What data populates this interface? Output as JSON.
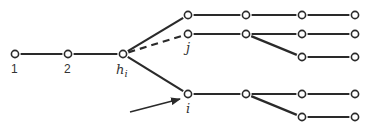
{
  "diagram": {
    "colors": {
      "stroke": "#2a2a2a",
      "node_fill": "#ffffff",
      "text": "#333333"
    },
    "nodes": [
      {
        "id": "n1",
        "x": 15,
        "y": 54,
        "label": "1"
      },
      {
        "id": "n2",
        "x": 68,
        "y": 54,
        "label": "2"
      },
      {
        "id": "hi",
        "x": 123,
        "y": 54,
        "label": "h",
        "sub": "i"
      },
      {
        "id": "t1",
        "x": 188,
        "y": 15
      },
      {
        "id": "t2",
        "x": 246,
        "y": 15
      },
      {
        "id": "t3",
        "x": 302,
        "y": 15
      },
      {
        "id": "t4",
        "x": 355,
        "y": 15
      },
      {
        "id": "j",
        "x": 188,
        "y": 34,
        "label": "j"
      },
      {
        "id": "j2",
        "x": 246,
        "y": 34
      },
      {
        "id": "j3",
        "x": 302,
        "y": 34
      },
      {
        "id": "j4",
        "x": 355,
        "y": 34
      },
      {
        "id": "jb3",
        "x": 302,
        "y": 57
      },
      {
        "id": "jb4",
        "x": 355,
        "y": 57
      },
      {
        "id": "i",
        "x": 188,
        "y": 94,
        "label": "i"
      },
      {
        "id": "i2",
        "x": 246,
        "y": 94
      },
      {
        "id": "i3",
        "x": 302,
        "y": 94
      },
      {
        "id": "i4",
        "x": 355,
        "y": 94
      },
      {
        "id": "ib3",
        "x": 302,
        "y": 117
      },
      {
        "id": "ib4",
        "x": 355,
        "y": 117
      }
    ],
    "edges": [
      {
        "from": "n1",
        "to": "n2",
        "style": "solid"
      },
      {
        "from": "n2",
        "to": "hi",
        "style": "solid"
      },
      {
        "from": "hi",
        "to": "t1",
        "style": "solid"
      },
      {
        "from": "hi",
        "to": "j",
        "style": "dashed"
      },
      {
        "from": "hi",
        "to": "i",
        "style": "solid"
      },
      {
        "from": "t1",
        "to": "t2",
        "style": "solid"
      },
      {
        "from": "t2",
        "to": "t3",
        "style": "solid"
      },
      {
        "from": "t3",
        "to": "t4",
        "style": "solid"
      },
      {
        "from": "j",
        "to": "j2",
        "style": "solid"
      },
      {
        "from": "j2",
        "to": "j3",
        "style": "solid"
      },
      {
        "from": "j3",
        "to": "j4",
        "style": "solid"
      },
      {
        "from": "j2",
        "to": "jb3",
        "style": "solid"
      },
      {
        "from": "jb3",
        "to": "jb4",
        "style": "solid"
      },
      {
        "from": "i",
        "to": "i2",
        "style": "solid"
      },
      {
        "from": "i2",
        "to": "i3",
        "style": "solid"
      },
      {
        "from": "i3",
        "to": "i4",
        "style": "solid"
      },
      {
        "from": "i2",
        "to": "ib3",
        "style": "solid"
      },
      {
        "from": "ib3",
        "to": "ib4",
        "style": "solid"
      }
    ],
    "labels": {
      "n1": "1",
      "n2": "2",
      "hi_main": "h",
      "hi_sub": "i",
      "j": "j",
      "i": "i"
    },
    "arrow": {
      "x1": 130,
      "y1": 112,
      "x2": 180,
      "y2": 99,
      "points_to": "i"
    }
  }
}
